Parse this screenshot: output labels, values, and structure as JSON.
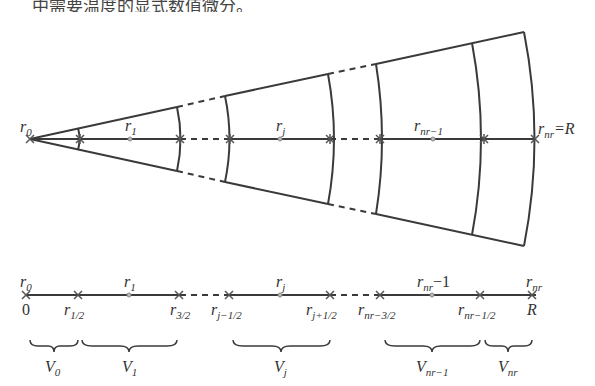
{
  "caption": "中需要温度的显式数值微分。",
  "fan": {
    "apex_label": "r0",
    "axis_labels": [
      {
        "id": "r1",
        "text": "r",
        "sub": "1",
        "x": 127
      },
      {
        "id": "rj",
        "text": "r",
        "sub": "j",
        "x": 282
      },
      {
        "id": "rnr-1",
        "text": "r",
        "sub": "nr−1",
        "x": 430
      },
      {
        "id": "rnr",
        "text": "r",
        "sub": "nr",
        "suffix": "=R",
        "x": 538
      }
    ]
  },
  "line": {
    "top_labels": [
      {
        "text": "r",
        "sub": "0",
        "x": 20
      },
      {
        "text": "r",
        "sub": "1",
        "x": 125
      },
      {
        "text": "r",
        "sub": "j",
        "x": 278
      },
      {
        "text": "r",
        "sub": "nr",
        "suffix": "−1",
        "x": 420
      },
      {
        "text": "r",
        "sub": "nr",
        "x": 535
      }
    ],
    "bottom_labels": [
      {
        "text": "0",
        "sub": "",
        "x": 24
      },
      {
        "text": "r",
        "sub": "1/2",
        "x": 66
      },
      {
        "text": "r",
        "sub": "3/2",
        "x": 172
      },
      {
        "text": "r",
        "sub": "j−1/2",
        "x": 212
      },
      {
        "text": "r",
        "sub": "j+1/2",
        "x": 318
      },
      {
        "text": "r",
        "sub": "nr−3/2",
        "x": 360
      },
      {
        "text": "r",
        "sub": "nr−1/2",
        "x": 460
      },
      {
        "text": "R",
        "sub": "",
        "x": 533
      }
    ],
    "volumes": [
      {
        "text": "V",
        "sub": "0",
        "x1": 30,
        "x2": 78
      },
      {
        "text": "V",
        "sub": "1",
        "x1": 82,
        "x2": 177
      },
      {
        "text": "V",
        "sub": "j",
        "x1": 233,
        "x2": 330
      },
      {
        "text": "V",
        "sub": "nr−1",
        "x1": 385,
        "x2": 480
      },
      {
        "text": "V",
        "sub": "nr",
        "x1": 485,
        "x2": 532
      }
    ]
  }
}
